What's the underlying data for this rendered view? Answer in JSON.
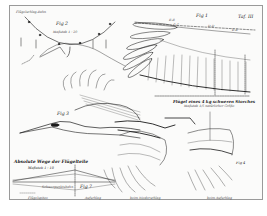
{
  "plate": {
    "plate_number": "Taf. III",
    "background_color": "#fbfbfa",
    "border_color": "#9a9a9a",
    "ink_color": "#1a1a1a"
  },
  "figures": {
    "fig1": {
      "label": "Fig 1",
      "caption": "Flügel eines 4 kg schweren Storches",
      "caption_sub": "Maßstab 1/5 natürlicher Größe",
      "section_labels": [
        "B-B",
        "C-C",
        "D-D",
        "E-E"
      ]
    },
    "fig2": {
      "label": "Fig 2",
      "scale": "Maßstab 1 : 20",
      "top_label": "Flügelschlag-Bahn"
    },
    "fig3": {
      "label": "Fig 3"
    },
    "fig4": {
      "label": "Fig 4",
      "bottom_label": "beim Aufschlag"
    },
    "fig5": {
      "label": "Fig 5",
      "bottom_label": "beim Niederschlag"
    },
    "fig7": {
      "label": "Fig 7",
      "title": "Absolute Wege der Flügelteile",
      "scale": "Maßstab 1 : 10",
      "labels": [
        "Flügelspitze",
        "Schwerpunktsbahn",
        "Aufschlag",
        "Niederschlag"
      ]
    }
  }
}
